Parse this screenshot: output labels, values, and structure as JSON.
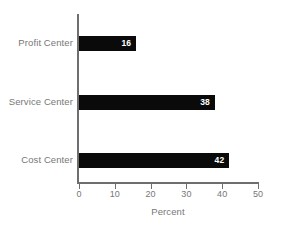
{
  "chart_data": {
    "type": "bar",
    "orientation": "horizontal",
    "title": "",
    "xlabel": "Percent",
    "ylabel": "",
    "categories": [
      "Profit Center",
      "Service Center",
      "Cost Center"
    ],
    "values": [
      16,
      38,
      42
    ],
    "value_labels": [
      "16",
      "38",
      "42"
    ],
    "xlim": [
      0,
      50
    ],
    "xticks": [
      0,
      10,
      20,
      30,
      40,
      50
    ],
    "xtick_labels": [
      "0",
      "10",
      "20",
      "30",
      "40",
      "50"
    ],
    "grid": false,
    "legend": false,
    "colors": {
      "bar": "#0a0a0a",
      "bar_value_text": "#ffffff",
      "axis": "#6e6e6e",
      "label_text": "#777777",
      "background": "#ffffff"
    }
  }
}
